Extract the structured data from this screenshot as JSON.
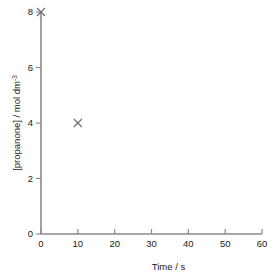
{
  "chart_data": {
    "type": "scatter",
    "title": "",
    "xlabel": "Time / s",
    "ylabel": "[propanone] / mol dm",
    "ylabel_sup": "-3",
    "ylabel_full": "[propanone] / mol dm⁻³",
    "xlim": [
      0,
      60
    ],
    "ylim": [
      0,
      8
    ],
    "xticks": [
      0,
      10,
      20,
      30,
      40,
      50,
      60
    ],
    "yticks": [
      0,
      2,
      4,
      6,
      8
    ],
    "xticklabels": [
      "0",
      "10",
      "20",
      "30",
      "40",
      "50",
      "60"
    ],
    "yticklabels": [
      "0",
      "2",
      "4",
      "6",
      "8"
    ],
    "grid": false,
    "legend": false,
    "marker": "x",
    "series": [
      {
        "name": "[propanone]",
        "points": [
          {
            "x": 0,
            "y": 8
          },
          {
            "x": 10,
            "y": 4
          }
        ]
      }
    ]
  },
  "style": {
    "axis_color": "#8a8a8a",
    "text_color": "#1a1a1a",
    "marker_color": "#6e6e6e",
    "background": "#ffffff"
  },
  "geometry": {
    "plot_left": 41,
    "plot_right": 262,
    "plot_top": 12,
    "plot_bottom": 234,
    "tick_len_x": 5,
    "tick_len_y": 5,
    "marker_half": 4
  }
}
